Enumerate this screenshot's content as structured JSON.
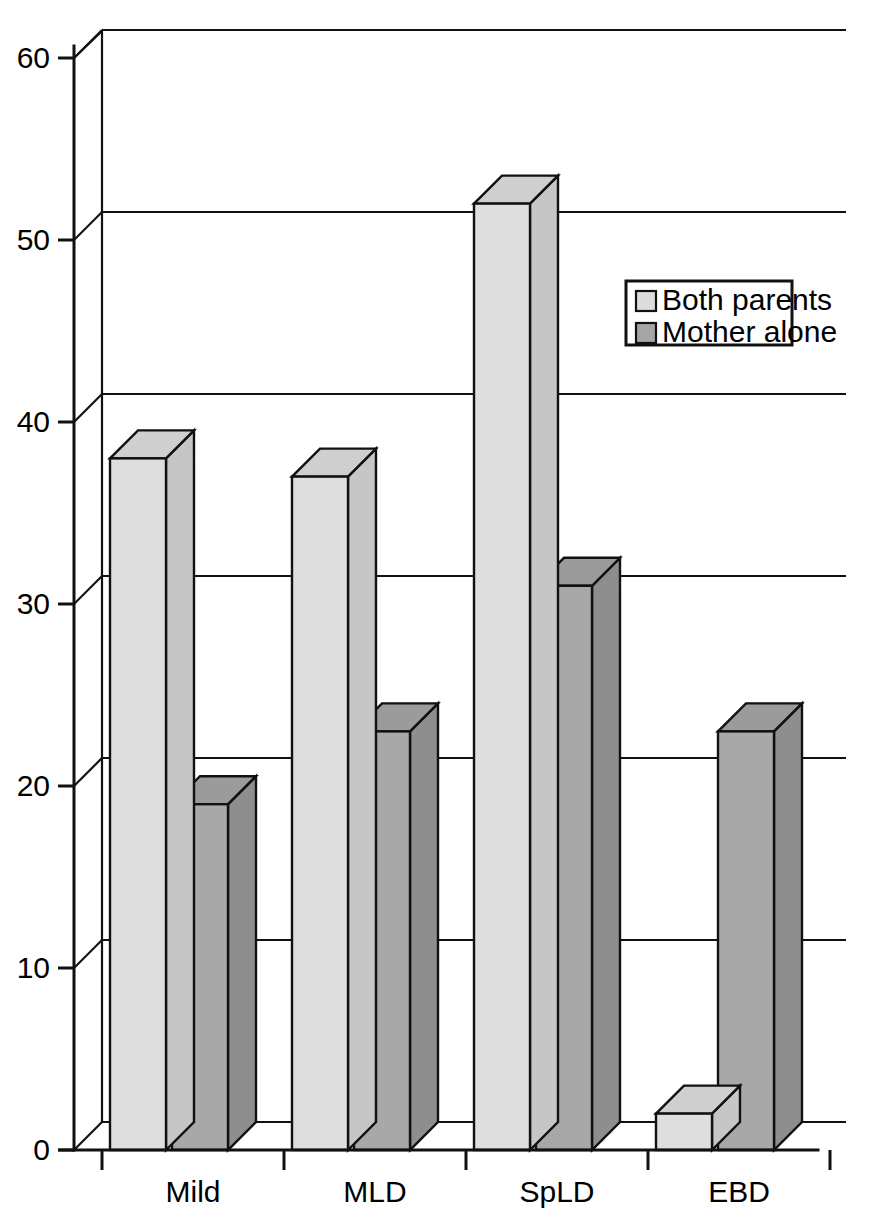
{
  "chart_data": {
    "type": "bar",
    "title": "",
    "subtitle": "",
    "xlabel": "",
    "ylabel": "",
    "categories": [
      "Mild",
      "MLD",
      "SpLD",
      "EBD"
    ],
    "series": [
      {
        "name": "Both parents",
        "values": [
          38,
          37,
          52,
          2
        ]
      },
      {
        "name": "Mother alone",
        "values": [
          19,
          23,
          31,
          23
        ]
      }
    ],
    "ylim": [
      0,
      60
    ],
    "yticks": [
      0,
      10,
      20,
      30,
      40,
      50,
      60
    ],
    "ytick_labels": [
      "0",
      "10",
      "20",
      "30",
      "40",
      "50",
      "60"
    ],
    "grid": true,
    "grid_axis": "y",
    "legend_position": "upper right",
    "three_d": true
  },
  "legend": {
    "entries": [
      {
        "label": "Both parents",
        "color": "#dcdcdc"
      },
      {
        "label": "Mother alone",
        "color": "#a6a6a6"
      }
    ]
  },
  "colors": {
    "series_1_front": "#dedede",
    "series_1_side": "#c6c6c6",
    "series_1_top": "#cfcfcf",
    "series_2_front": "#a8a8a8",
    "series_2_side": "#8e8e8e",
    "series_2_top": "#9b9b9b",
    "outline": "#111111",
    "background": "#ffffff"
  }
}
